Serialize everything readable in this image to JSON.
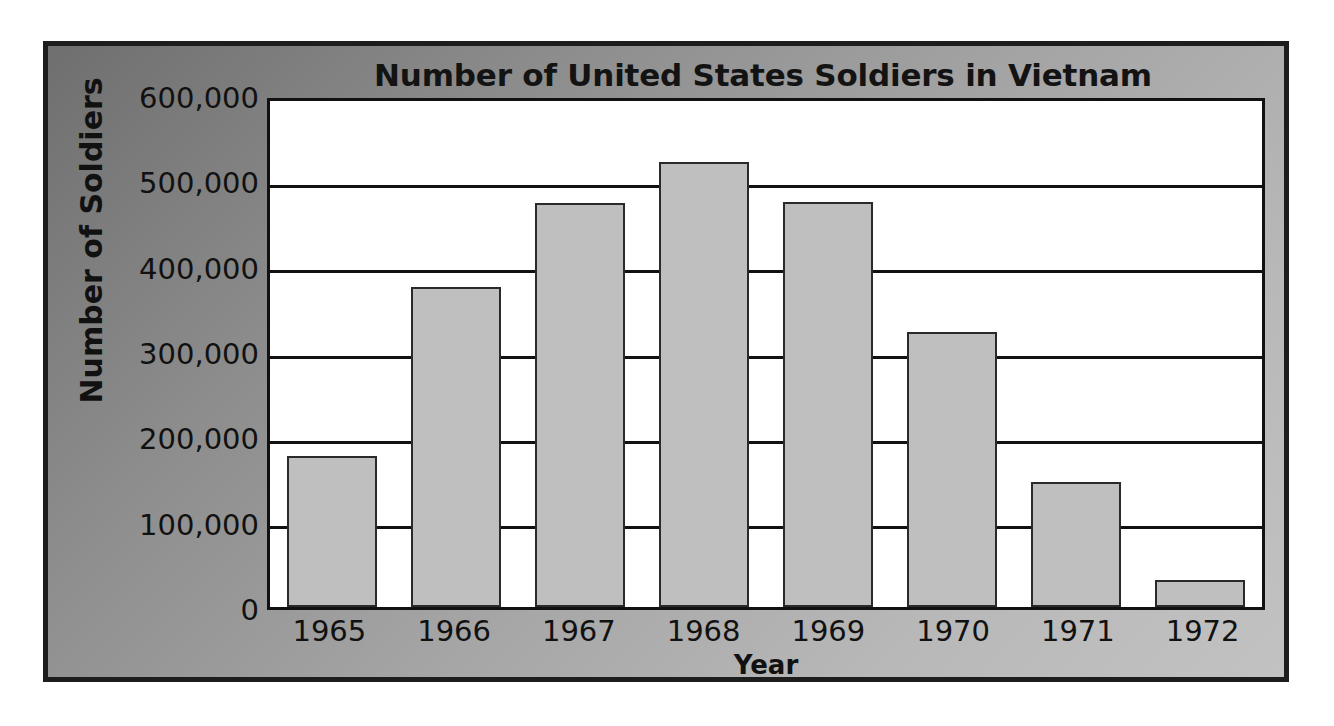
{
  "chart_data": {
    "type": "bar",
    "title": "Number of United States Soldiers in Vietnam",
    "xlabel": "Year",
    "ylabel": "Number of Soldiers",
    "categories": [
      "1965",
      "1966",
      "1967",
      "1968",
      "1969",
      "1970",
      "1971",
      "1972"
    ],
    "values": [
      177000,
      375000,
      473000,
      522000,
      475000,
      322000,
      147000,
      32000
    ],
    "ylim": [
      0,
      600000
    ],
    "ytick_values": [
      0,
      100000,
      200000,
      300000,
      400000,
      500000,
      600000
    ],
    "ytick_labels": [
      "0",
      "100,000",
      "200,000",
      "300,000",
      "400,000",
      "500,000",
      "600,000"
    ],
    "grid": true,
    "legend": null,
    "bar_color": "#bfbfbf",
    "bar_edge_color": "#2a2a2a",
    "plot_background": "#ffffff",
    "panel_background": "#a0a0a0",
    "text_color": "#111111"
  }
}
